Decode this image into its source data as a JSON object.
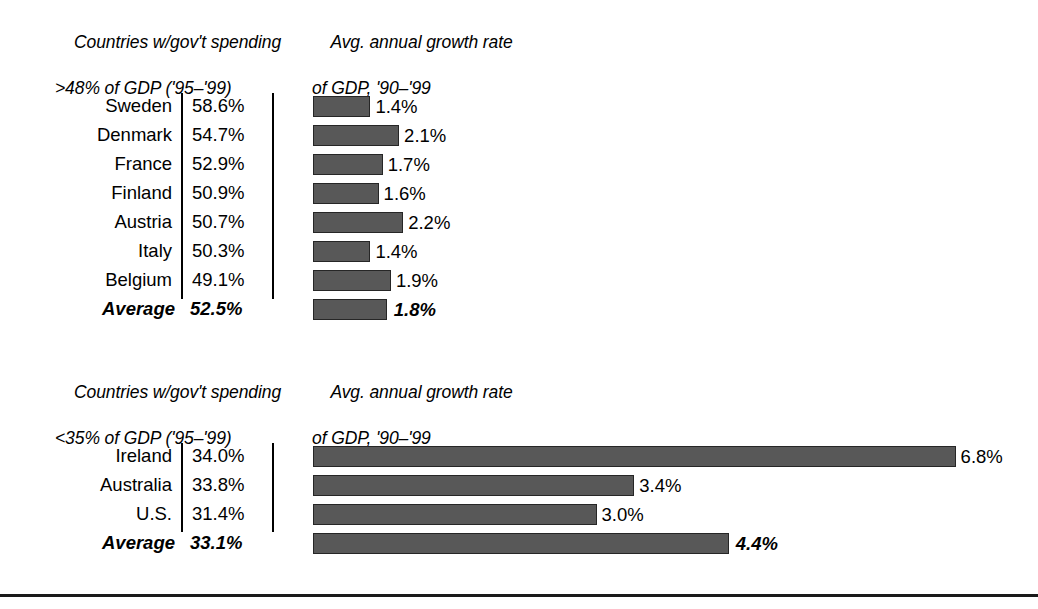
{
  "chart_data": {
    "type": "bar",
    "title": "",
    "orientation": "horizontal",
    "xlabel": "",
    "ylabel": "",
    "grid": false,
    "legend": "none",
    "panels": [
      {
        "id": "high-spending",
        "header_left_line1": "Countries w/gov't spending",
        "header_left_line2": ">48% of GDP ('95–'99)",
        "header_right_line1": "Avg. annual growth rate",
        "header_right_line2": "of GDP, '90–'99",
        "spending_column_label": "gov't spending % of GDP",
        "growth_column_label": "avg annual GDP growth %",
        "pixels_per_percent": 41,
        "categories": [
          "Sweden",
          "Denmark",
          "France",
          "Finland",
          "Austria",
          "Italy",
          "Belgium",
          "Average"
        ],
        "spending_values": [
          "58.6%",
          "54.7%",
          "52.9%",
          "50.9%",
          "50.7%",
          "50.3%",
          "49.1%",
          "52.5%"
        ],
        "growth_values": [
          1.4,
          2.1,
          1.7,
          1.6,
          2.2,
          1.4,
          1.9,
          1.8
        ],
        "growth_labels": [
          "1.4%",
          "2.1%",
          "1.7%",
          "1.6%",
          "2.2%",
          "1.4%",
          "1.9%",
          "1.8%"
        ],
        "average_row_index": 7
      },
      {
        "id": "low-spending",
        "header_left_line1": "Countries w/gov't spending",
        "header_left_line2": "<35% of GDP ('95–'99)",
        "header_right_line1": "Avg. annual growth rate",
        "header_right_line2": "of GDP, '90–'99",
        "spending_column_label": "gov't spending % of GDP",
        "growth_column_label": "avg annual GDP growth %",
        "pixels_per_percent": 94.5,
        "categories": [
          "Ireland",
          "Australia",
          "U.S.",
          "Average"
        ],
        "spending_values": [
          "34.0%",
          "33.8%",
          "31.4%",
          "33.1%"
        ],
        "growth_values": [
          6.8,
          3.4,
          3.0,
          4.4
        ],
        "growth_labels": [
          "6.8%",
          "3.4%",
          "3.0%",
          "4.4%"
        ],
        "average_row_index": 3
      }
    ],
    "colors": {
      "bar_fill": "#585858",
      "bar_outline": "#262626",
      "text": "#000000",
      "rule": "#1a1a1a",
      "background": "#ffffff"
    }
  }
}
